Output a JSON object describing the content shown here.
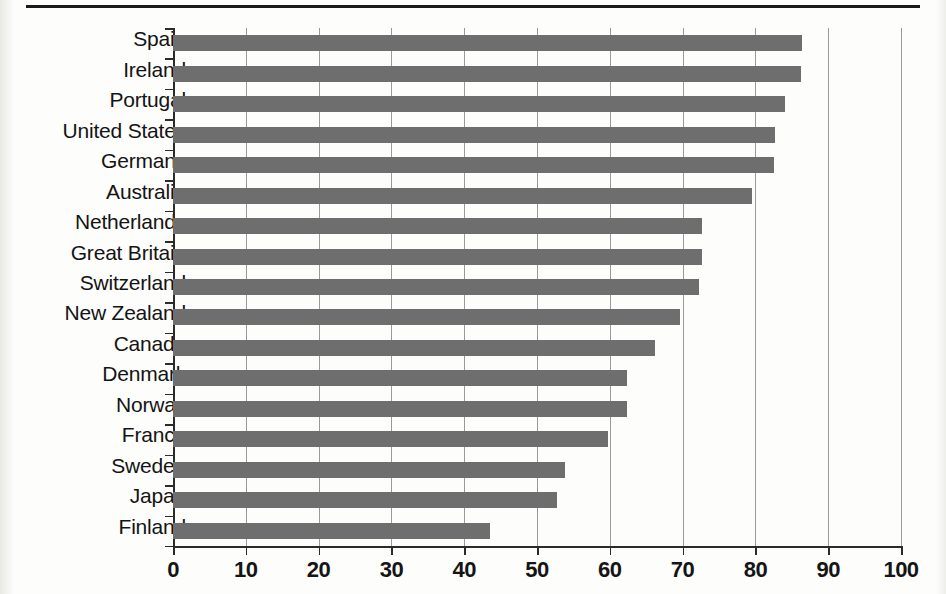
{
  "chart_data": {
    "type": "bar",
    "orientation": "horizontal",
    "title": "",
    "subtitle": "",
    "xlabel": "",
    "ylabel": "",
    "xlim": [
      0,
      100
    ],
    "ylim": null,
    "xticks": [
      0,
      10,
      20,
      30,
      40,
      50,
      60,
      70,
      80,
      90,
      100
    ],
    "xtick_labels": [
      "0",
      "10",
      "20",
      "30",
      "40",
      "50",
      "60",
      "70",
      "80",
      "90",
      "100"
    ],
    "grid": "vertical",
    "legend": null,
    "legend_position": "none",
    "annotations": [],
    "bar_color": "#6e6e6e",
    "axis_color": "#2b2b2b",
    "gridline_color": "#9a9a9a",
    "background_color": "#fdfdfc",
    "categories": [
      "Spain",
      "Ireland",
      "Portugal",
      "United States",
      "Germany",
      "Australia",
      "Netherlands",
      "Great Britain",
      "Switzerland",
      "New Zealand",
      "Canada",
      "Denmark",
      "Norway",
      "France",
      "Sweden",
      "Japan",
      "Finland"
    ],
    "values": [
      86.4,
      86.3,
      84.1,
      82.7,
      82.6,
      79.5,
      72.7,
      72.6,
      72.3,
      69.6,
      66.2,
      62.4,
      62.3,
      59.7,
      53.8,
      52.7,
      43.5
    ],
    "series": [
      {
        "name": "",
        "values": [
          86.4,
          86.3,
          84.1,
          82.7,
          82.6,
          79.5,
          72.7,
          72.6,
          72.3,
          69.6,
          66.2,
          62.4,
          62.3,
          59.7,
          53.8,
          52.7,
          43.5
        ]
      }
    ]
  }
}
